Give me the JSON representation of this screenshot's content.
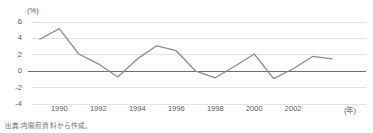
{
  "chart_data": {
    "type": "line",
    "title": "",
    "subtitle": "",
    "xlabel": "(年)",
    "ylabel": "(%)",
    "unit_label": "(%)",
    "x_unit_label": "(年)",
    "xlim": [
      1988.6,
      2004.4
    ],
    "ylim": [
      -4,
      6
    ],
    "yticks": [
      6,
      4,
      2,
      0,
      -2,
      -4
    ],
    "ytick_labels": [
      "6",
      "4",
      "2",
      "0",
      "-2",
      "-4"
    ],
    "xticks": [
      1990,
      1992,
      1994,
      1996,
      1998,
      2000,
      2002
    ],
    "xtick_labels": [
      "1990",
      "1992",
      "1994",
      "1996",
      "1998",
      "2000",
      "2002"
    ],
    "grid": true,
    "grid_axis": "y",
    "legend": false,
    "legend_position": "none",
    "zero_line": true,
    "x": [
      1989,
      1990,
      1991,
      1992,
      1993,
      1994,
      1995,
      1996,
      1997,
      1998,
      1999,
      2000,
      2001,
      2002,
      2003,
      2004
    ],
    "series": [
      {
        "name": "経済成長率",
        "color": "#8c8c8e",
        "values": [
          3.9,
          5.2,
          2.1,
          0.9,
          -0.7,
          1.5,
          3.1,
          2.5,
          0.0,
          -0.8,
          0.6,
          2.1,
          -0.9,
          0.3,
          1.8,
          1.5
        ]
      }
    ],
    "annotations": [],
    "source_note": "出典:内閣府資料から作成。"
  },
  "figure": {
    "source_note": "出典:内閣府資料から作成。",
    "unit_label": "(%)",
    "x_unit_label": "(年)"
  },
  "colors": {
    "line": "#8c8c8e",
    "zero_line": "#6e6e70",
    "grid": "#e3e3e5",
    "text": "#58585a",
    "background": "#ffffff"
  }
}
